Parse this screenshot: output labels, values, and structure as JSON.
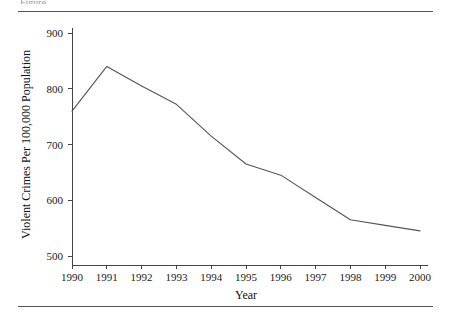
{
  "figure": {
    "caption_fragment": "Figure",
    "rules": {
      "top_label": "top-rule",
      "bottom_label": "bottom-rule"
    }
  },
  "chart_data": {
    "type": "line",
    "title": "",
    "xlabel": "Year",
    "ylabel": "Violent Crimes Per 100,000 Population",
    "categories": [
      "1990",
      "1991",
      "1992",
      "1993",
      "1994",
      "1995",
      "1996",
      "1997",
      "1998",
      "1999",
      "2000"
    ],
    "x": [
      1990,
      1991,
      1992,
      1993,
      1994,
      1995,
      1996,
      1997,
      1998,
      1999,
      2000
    ],
    "values": [
      760,
      840,
      805,
      772,
      715,
      665,
      645,
      605,
      565,
      555,
      545
    ],
    "series": [
      {
        "name": "Violent Crime Rate",
        "values": [
          760,
          840,
          805,
          772,
          715,
          665,
          645,
          605,
          565,
          555,
          545
        ]
      }
    ],
    "ylim": [
      500,
      900
    ],
    "xlim": [
      1990,
      2000
    ],
    "yticks": [
      500,
      600,
      700,
      800,
      900
    ],
    "ytick_labels": [
      "500",
      "600",
      "700",
      "800",
      "900"
    ],
    "xticks": [
      1990,
      1991,
      1992,
      1993,
      1994,
      1995,
      1996,
      1997,
      1998,
      1999,
      2000
    ],
    "xtick_labels": [
      "1990",
      "1991",
      "1992",
      "1993",
      "1994",
      "1995",
      "1996",
      "1997",
      "1998",
      "1999",
      "2000"
    ],
    "grid": false,
    "legend": null,
    "legend_position": "none",
    "line_color": "#555555",
    "axis_color": "#444444",
    "background_color": "#ffffff"
  }
}
